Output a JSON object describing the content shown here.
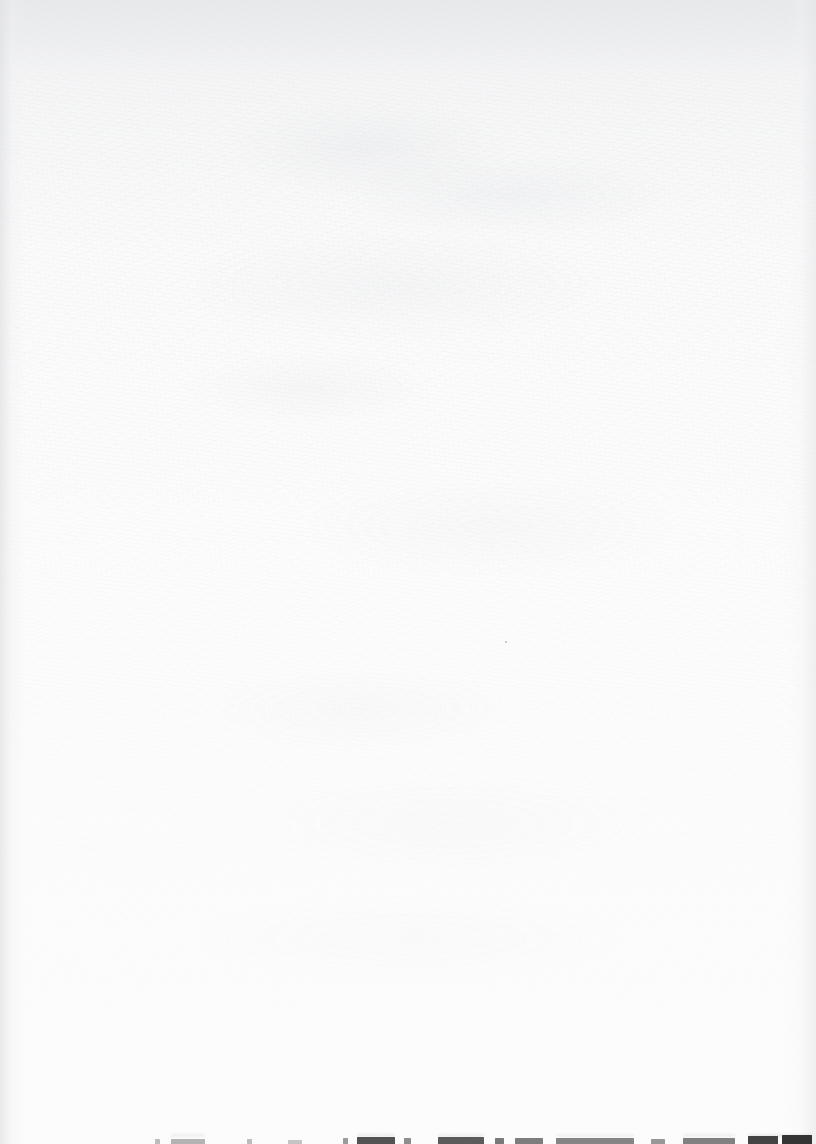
{
  "document": {
    "kind": "scanned-page",
    "page_width": 816,
    "page_height": 1144,
    "description": "Blank scanned document page; the only content is the top few pixel rows of a single line of text clipped by the bottom page boundary.",
    "background_color": "#fcfcfc",
    "paper_tint_color": "#eaebed",
    "ink_color": "#2a2a2a",
    "body_text": "",
    "visible_text": "",
    "legible_text_present": false,
    "note": "No text on this page is legible; the bottom line is cut off above the x-height."
  },
  "clipped_text_line": {
    "baseline_visible": false,
    "clipped_at_bottom": true,
    "starts_at_x": 155,
    "ends_at_x": 812,
    "top_y": 1134,
    "fragments": [
      {
        "x": 155,
        "width": 5,
        "height": 5,
        "opacity": 0.3
      },
      {
        "x": 171,
        "width": 34,
        "height": 5,
        "opacity": 0.34
      },
      {
        "x": 247,
        "width": 5,
        "height": 5,
        "opacity": 0.3
      },
      {
        "x": 288,
        "width": 14,
        "height": 4,
        "opacity": 0.26
      },
      {
        "x": 343,
        "width": 5,
        "height": 6,
        "opacity": 0.46
      },
      {
        "x": 357,
        "width": 38,
        "height": 7,
        "opacity": 0.8
      },
      {
        "x": 404,
        "width": 7,
        "height": 6,
        "opacity": 0.52
      },
      {
        "x": 438,
        "width": 46,
        "height": 7,
        "opacity": 0.76
      },
      {
        "x": 495,
        "width": 9,
        "height": 6,
        "opacity": 0.62
      },
      {
        "x": 515,
        "width": 28,
        "height": 6,
        "opacity": 0.6
      },
      {
        "x": 556,
        "width": 78,
        "height": 6,
        "opacity": 0.56
      },
      {
        "x": 651,
        "width": 14,
        "height": 5,
        "opacity": 0.48
      },
      {
        "x": 683,
        "width": 52,
        "height": 6,
        "opacity": 0.58
      },
      {
        "x": 748,
        "width": 30,
        "height": 8,
        "opacity": 0.88
      },
      {
        "x": 782,
        "width": 30,
        "height": 9,
        "opacity": 0.95
      }
    ],
    "ghost_fragments": [
      {
        "x": 171,
        "width": 34,
        "height": 3,
        "opacity": 0.22
      },
      {
        "x": 357,
        "width": 38,
        "height": 3,
        "opacity": 0.28
      },
      {
        "x": 438,
        "width": 46,
        "height": 3,
        "opacity": 0.26
      },
      {
        "x": 556,
        "width": 78,
        "height": 3,
        "opacity": 0.2
      },
      {
        "x": 683,
        "width": 52,
        "height": 3,
        "opacity": 0.22
      },
      {
        "x": 748,
        "width": 64,
        "height": 3,
        "opacity": 0.34
      }
    ]
  },
  "artifacts": {
    "specks": [
      {
        "x": 505,
        "y": 641,
        "color": "#b9bbbe"
      }
    ]
  }
}
